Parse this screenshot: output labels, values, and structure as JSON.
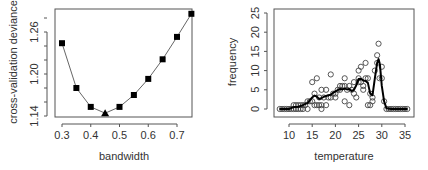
{
  "chart_data": [
    {
      "type": "line",
      "title": "",
      "xlabel": "bandwidth",
      "ylabel": "cross-validation deviance",
      "x": [
        0.3,
        0.35,
        0.4,
        0.45,
        0.5,
        0.55,
        0.6,
        0.65,
        0.7,
        0.75
      ],
      "values": [
        1.244,
        1.18,
        1.153,
        1.144,
        1.153,
        1.17,
        1.193,
        1.221,
        1.253,
        1.286
      ],
      "minimum": {
        "x": 0.45,
        "y": 1.144,
        "marker": "triangle"
      },
      "marker": "square",
      "xticks": [
        "0.3",
        "0.4",
        "0.5",
        "0.6",
        "0.7"
      ],
      "yticks": [
        "1.14",
        "1.20",
        "1.26"
      ],
      "xlim": [
        0.29,
        0.76
      ],
      "ylim": [
        1.14,
        1.29
      ],
      "grid": false,
      "legend": null
    },
    {
      "type": "scatter",
      "title": "",
      "xlabel": "temperature",
      "ylabel": "frequency",
      "xticks": [
        "10",
        "15",
        "20",
        "25",
        "30",
        "35"
      ],
      "yticks": [
        "0",
        "5",
        "10",
        "15",
        "20",
        "25"
      ],
      "xlim": [
        7.5,
        36
      ],
      "ylim": [
        -1,
        27
      ],
      "grid": false,
      "legend": null,
      "series": [
        {
          "name": "observed",
          "style": "open-circle",
          "points": [
            [
              8,
              0
            ],
            [
              8.5,
              0
            ],
            [
              9,
              0
            ],
            [
              9.5,
              0
            ],
            [
              10,
              0
            ],
            [
              10.5,
              0
            ],
            [
              11,
              0
            ],
            [
              11,
              1
            ],
            [
              11.5,
              0
            ],
            [
              11.5,
              1
            ],
            [
              12,
              0
            ],
            [
              12,
              1
            ],
            [
              12.5,
              0
            ],
            [
              12.5,
              1
            ],
            [
              13,
              0
            ],
            [
              13,
              1
            ],
            [
              13.5,
              1
            ],
            [
              14,
              2
            ],
            [
              14,
              0
            ],
            [
              14.5,
              2
            ],
            [
              15,
              7
            ],
            [
              15,
              2
            ],
            [
              15.5,
              4
            ],
            [
              15.5,
              1
            ],
            [
              16,
              8
            ],
            [
              16,
              1
            ],
            [
              16.5,
              3
            ],
            [
              16.5,
              1
            ],
            [
              17,
              5
            ],
            [
              17,
              0
            ],
            [
              17,
              1
            ],
            [
              17.5,
              3
            ],
            [
              18,
              5
            ],
            [
              18,
              1
            ],
            [
              18.5,
              3
            ],
            [
              19,
              9
            ],
            [
              19,
              3
            ],
            [
              19.5,
              4
            ],
            [
              20,
              3
            ],
            [
              20,
              4
            ],
            [
              20.5,
              5
            ],
            [
              21,
              6
            ],
            [
              21,
              5
            ],
            [
              21.5,
              6
            ],
            [
              22,
              8
            ],
            [
              22,
              2
            ],
            [
              22,
              6
            ],
            [
              22.5,
              5
            ],
            [
              23,
              6
            ],
            [
              23,
              1
            ],
            [
              23.5,
              5
            ],
            [
              24,
              4
            ],
            [
              24,
              7
            ],
            [
              24.5,
              3
            ],
            [
              25,
              8
            ],
            [
              25,
              10
            ],
            [
              25,
              7
            ],
            [
              25.5,
              11
            ],
            [
              25.5,
              7
            ],
            [
              26,
              6
            ],
            [
              26,
              5
            ],
            [
              26.5,
              12
            ],
            [
              26.5,
              8
            ],
            [
              27,
              8
            ],
            [
              27,
              1
            ],
            [
              27.5,
              1
            ],
            [
              27.5,
              4
            ],
            [
              28,
              3
            ],
            [
              28,
              2
            ],
            [
              28.5,
              10
            ],
            [
              29,
              14
            ],
            [
              29,
              12
            ],
            [
              29.3,
              17
            ],
            [
              29.5,
              8
            ],
            [
              30,
              11
            ],
            [
              30,
              8
            ],
            [
              30.5,
              2
            ],
            [
              31,
              0
            ],
            [
              31.5,
              0
            ],
            [
              32,
              0
            ],
            [
              32.5,
              0
            ],
            [
              33,
              0
            ],
            [
              33.5,
              0
            ],
            [
              34,
              0
            ],
            [
              34.5,
              0
            ],
            [
              35,
              0
            ],
            [
              35.5,
              0
            ]
          ]
        },
        {
          "name": "smoothed",
          "style": "thick-line",
          "x": [
            8,
            10,
            11,
            12,
            13,
            14,
            15,
            15.5,
            16,
            16.5,
            17,
            17.5,
            18,
            18.5,
            19,
            19.5,
            20,
            20.5,
            21,
            21.5,
            22,
            22.5,
            23,
            23.5,
            24,
            24.5,
            25,
            25.5,
            26,
            26.5,
            27,
            27.5,
            28,
            28.5,
            29,
            29.3,
            29.6,
            30,
            30.5,
            31,
            32,
            35.5
          ],
          "values": [
            0,
            0,
            0.5,
            0.6,
            1.0,
            1.6,
            3.0,
            3.5,
            3.2,
            2.6,
            2.8,
            3.2,
            3.4,
            3.6,
            3.7,
            4.2,
            4.6,
            4.9,
            5.2,
            5.1,
            5.3,
            5.1,
            5.2,
            4.7,
            5.0,
            6.2,
            7.8,
            7.9,
            7.4,
            7.3,
            6.8,
            4.0,
            3.6,
            8.0,
            12.0,
            13.0,
            11.5,
            6.0,
            2.0,
            0.2,
            0,
            0
          ]
        }
      ]
    }
  ]
}
